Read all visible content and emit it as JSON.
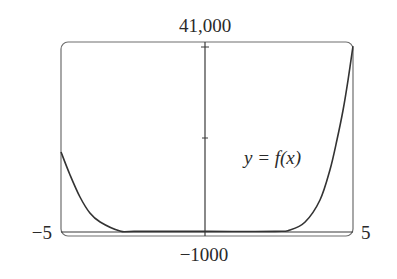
{
  "chart_data": {
    "type": "line",
    "title": "",
    "xlabel": "",
    "ylabel": "",
    "xlim": [
      -5,
      5
    ],
    "ylim": [
      -1000,
      41000
    ],
    "grid": false,
    "legend": null,
    "tick_labels": {
      "x_min": "−5",
      "x_max": "5",
      "y_max": "41,000",
      "y_min": "−1000"
    },
    "y_ticks": [
      20000,
      41000
    ],
    "annotations": [
      {
        "text": "y = f(x)",
        "x": 3.1,
        "y": 15500
      }
    ],
    "series": [
      {
        "name": "y = f(x)",
        "x": [
          -5,
          -4.69,
          -4.35,
          -4.01,
          -3.66,
          -2.98,
          -2.47,
          0,
          2.33,
          2.84,
          3.36,
          3.87,
          4.21,
          4.45,
          4.66,
          4.83,
          5
        ],
        "y": [
          17185,
          12206,
          7443,
          3980,
          2030,
          80,
          0,
          0,
          0,
          300,
          2030,
          6800,
          13290,
          19780,
          26280,
          32770,
          40130
        ]
      }
    ]
  },
  "labels": {
    "y_max": "41,000",
    "y_min": "−1000",
    "x_min": "−5",
    "x_max": "5",
    "curve": "y = f(x)"
  },
  "colors": {
    "frame": "#6e6e6e",
    "axis": "#3a3a3a",
    "curve": "#333333",
    "text": "#2a2a2a"
  }
}
